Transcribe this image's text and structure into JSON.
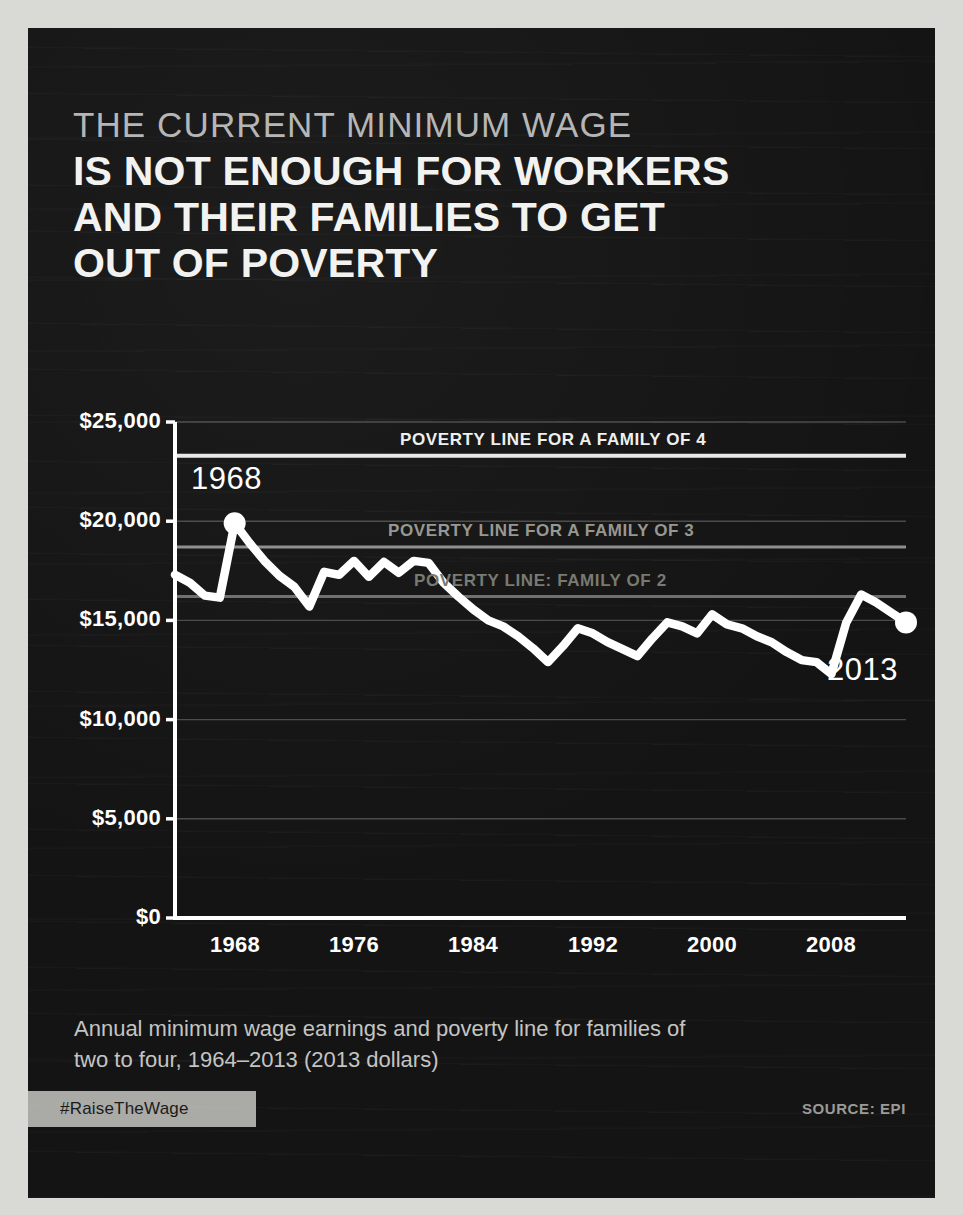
{
  "poster": {
    "eyebrow": "THE CURRENT MINIMUM WAGE",
    "headline_lines": [
      "IS NOT ENOUGH FOR WORKERS",
      "AND THEIR FAMILIES TO GET",
      "OUT OF POVERTY"
    ],
    "caption_lines": [
      "Annual minimum wage earnings and poverty line for families of",
      "two to four, 1964–2013 (2013 dollars)"
    ],
    "hashtag": "#RaiseTheWage",
    "source": "SOURCE: EPI",
    "colors": {
      "background": "#141414",
      "page_margin": "#d9d9d6",
      "headline": "#f2f2f0",
      "eyebrow": "#b4b4b4",
      "data_line": "#ffffff",
      "badge": "#aaaaa6"
    }
  },
  "chart_data": {
    "type": "line",
    "title": "",
    "xlabel": "",
    "ylabel": "",
    "xlim": [
      1964,
      2013
    ],
    "ylim": [
      0,
      25000
    ],
    "grid": true,
    "legend": "inline-labels",
    "ytick_labels": [
      "$25,000",
      "$20,000",
      "$15,000",
      "$10,000",
      "$5,000",
      "$0"
    ],
    "ytick_values": [
      25000,
      20000,
      15000,
      10000,
      5000,
      0
    ],
    "xtick_labels": [
      "1968",
      "1976",
      "1984",
      "1992",
      "2000",
      "2008"
    ],
    "xtick_values": [
      1968,
      1976,
      1984,
      1992,
      2000,
      2008
    ],
    "series": [
      {
        "name": "Annual minimum wage earnings (2013 dollars)",
        "color": "#ffffff",
        "x": [
          1964,
          1965,
          1966,
          1967,
          1968,
          1969,
          1970,
          1971,
          1972,
          1973,
          1974,
          1975,
          1976,
          1977,
          1978,
          1979,
          1980,
          1981,
          1982,
          1983,
          1984,
          1985,
          1986,
          1987,
          1988,
          1989,
          1990,
          1991,
          1992,
          1993,
          1994,
          1995,
          1996,
          1997,
          1998,
          1999,
          2000,
          2001,
          2002,
          2003,
          2004,
          2005,
          2006,
          2007,
          2008,
          2009,
          2010,
          2011,
          2012,
          2013
        ],
        "values": [
          17300,
          16900,
          16250,
          16150,
          19900,
          18900,
          18000,
          17250,
          16700,
          15700,
          17450,
          17300,
          18000,
          17200,
          17950,
          17400,
          18000,
          17900,
          16900,
          16200,
          15550,
          15000,
          14700,
          14200,
          13600,
          12900,
          13700,
          14600,
          14350,
          13900,
          13550,
          13200,
          14100,
          14900,
          14700,
          14350,
          15300,
          14800,
          14600,
          14200,
          13900,
          13400,
          13000,
          12900,
          12300,
          14900,
          16300,
          15900,
          15400,
          14900
        ]
      }
    ],
    "reference_lines": [
      {
        "name": "POVERTY LINE FOR A FAMILY OF 4",
        "value": 23300,
        "color": "#e8e8e6",
        "label_color": "#efefed"
      },
      {
        "name": "POVERTY LINE FOR A FAMILY OF 3",
        "value": 18700,
        "color": "#8e8e8c",
        "label_color": "#96968f"
      },
      {
        "name": "POVERTY LINE: FAMILY OF 2",
        "value": 16200,
        "color": "#6e6e6c",
        "label_color": "#78786f"
      }
    ],
    "annotations": [
      {
        "text": "1968",
        "x": 1968,
        "y": 19900,
        "marker": true,
        "position": "above-left"
      },
      {
        "text": "2013",
        "x": 2013,
        "y": 14900,
        "marker": true,
        "position": "below-left"
      }
    ]
  }
}
